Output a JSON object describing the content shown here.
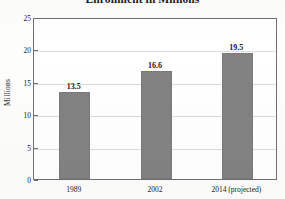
{
  "chart_data": {
    "type": "bar",
    "title": "Enrollment in Millions",
    "xlabel": "",
    "ylabel": "Millions",
    "categories": [
      "1989",
      "2002",
      "2014 (projected)"
    ],
    "values": [
      13.5,
      16.6,
      19.5
    ],
    "value_labels": [
      "13.5",
      "16.6",
      "19.5"
    ],
    "ylim": [
      0,
      25
    ],
    "yticks": [
      0,
      5,
      10,
      15,
      20,
      25
    ],
    "ytick_labels": [
      "0",
      "5",
      "10",
      "15",
      "20",
      "25"
    ],
    "grid": true,
    "legend": false,
    "bar_color": "#828282",
    "gridline_color": "#dcdcdc",
    "axis_color": "#6f6f6f",
    "text_color": "#232323",
    "background_color": "#ffffff"
  }
}
